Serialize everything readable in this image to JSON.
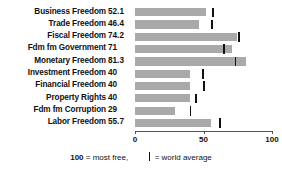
{
  "chart_data": {
    "type": "bar",
    "title": "",
    "xlabel": "",
    "ylabel": "",
    "orientation": "horizontal",
    "xlim": [
      0,
      100
    ],
    "xticks": [
      0,
      50,
      100
    ],
    "xtick_labels": [
      "0",
      "50",
      "100"
    ],
    "grid": false,
    "bar_color": "#a9a9a9",
    "marker_color": "#111111",
    "categories": [
      "Business Freedom",
      "Trade Freedom",
      "Fiscal Freedom",
      "Fdm fm Government",
      "Monetary Freedom",
      "Investment Freedom",
      "Financial Freedom",
      "Property Rights",
      "Fdm fm Corruption",
      "Labor Freedom"
    ],
    "values": [
      52.1,
      46.4,
      74.2,
      71,
      81.3,
      40,
      40,
      40,
      29,
      55.7
    ],
    "value_labels": [
      "52.1",
      "46.4",
      "74.2",
      "71",
      "81.3",
      "40",
      "40",
      "40",
      "29",
      "55.7"
    ],
    "series": [
      {
        "name": "country score",
        "values": [
          52.1,
          46.4,
          74.2,
          71,
          81.3,
          40,
          40,
          40,
          29,
          55.7
        ]
      },
      {
        "name": "world average",
        "values": [
          57.0,
          56.0,
          76.0,
          65.0,
          73.5,
          49.5,
          50.5,
          44.5,
          40.5,
          62.0
        ]
      }
    ]
  },
  "legend": {
    "most_free_value": "100",
    "most_free_text": "= most free,",
    "world_average_text": "= world average"
  }
}
